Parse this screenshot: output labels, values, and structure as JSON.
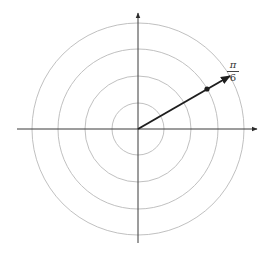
{
  "diagram": {
    "type": "polar-grid",
    "center": {
      "x": 138,
      "y": 129
    },
    "circle_radii": [
      26,
      53,
      80,
      106
    ],
    "colors": {
      "grid": "#b9b9b9",
      "axis": "#3a3a3a",
      "vector": "#1e1e1e"
    },
    "point": {
      "angle_label_num": "π",
      "angle_label_den": "6",
      "angle_degrees": 30,
      "radius_index": 3
    }
  }
}
